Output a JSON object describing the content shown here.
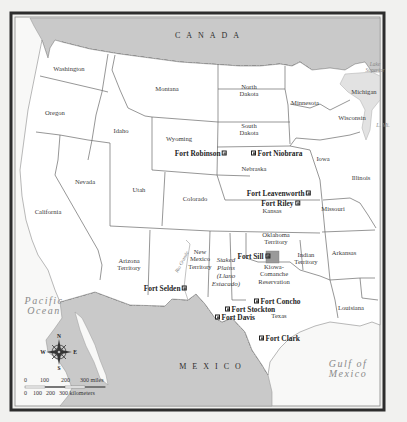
{
  "map": {
    "countries": [
      {
        "id": "canada",
        "label": "CANADA",
        "x": 210,
        "y": 35
      },
      {
        "id": "mexico",
        "label": "MEXICO",
        "x": 213,
        "y": 366
      }
    ],
    "water_bodies": [
      {
        "id": "pacific-ocean",
        "label": "Pacific\nOcean",
        "x": 44,
        "y": 306
      },
      {
        "id": "gulf-of-mexico",
        "label": "Gulf of\nMexico",
        "x": 348,
        "y": 369
      },
      {
        "id": "lake-superior",
        "label": "Lake\nSuperior",
        "x": 375,
        "y": 67
      },
      {
        "id": "lake-michigan",
        "label": "L. Mi.",
        "x": 383,
        "y": 125
      }
    ],
    "states": [
      {
        "id": "washington",
        "label": "Washington",
        "x": 69,
        "y": 69
      },
      {
        "id": "oregon",
        "label": "Oregon",
        "x": 55,
        "y": 113
      },
      {
        "id": "idaho",
        "label": "Idaho",
        "x": 121,
        "y": 131
      },
      {
        "id": "montana",
        "label": "Montana",
        "x": 167,
        "y": 89
      },
      {
        "id": "wyoming",
        "label": "Wyoming",
        "x": 179,
        "y": 139
      },
      {
        "id": "north-dakota",
        "label": "North\nDakota",
        "x": 249,
        "y": 90
      },
      {
        "id": "south-dakota",
        "label": "South\nDakota",
        "x": 249,
        "y": 129
      },
      {
        "id": "minnesota",
        "label": "Minnesota",
        "x": 305,
        "y": 103
      },
      {
        "id": "wisconsin",
        "label": "Wisconsin",
        "x": 352,
        "y": 118
      },
      {
        "id": "michigan",
        "label": "Michigan",
        "x": 364,
        "y": 92
      },
      {
        "id": "iowa",
        "label": "Iowa",
        "x": 323,
        "y": 159
      },
      {
        "id": "illinois",
        "label": "Illinois",
        "x": 361,
        "y": 178
      },
      {
        "id": "nebraska",
        "label": "Nebraska",
        "x": 254,
        "y": 169
      },
      {
        "id": "nevada",
        "label": "Nevada",
        "x": 85,
        "y": 182
      },
      {
        "id": "utah",
        "label": "Utah",
        "x": 139,
        "y": 190
      },
      {
        "id": "colorado",
        "label": "Colorado",
        "x": 195,
        "y": 199
      },
      {
        "id": "kansas",
        "label": "Kansas",
        "x": 272,
        "y": 211
      },
      {
        "id": "missouri",
        "label": "Missouri",
        "x": 333,
        "y": 209
      },
      {
        "id": "california",
        "label": "California",
        "x": 48,
        "y": 212
      },
      {
        "id": "arizona-territory",
        "label": "Arizona\nTerritory",
        "x": 129,
        "y": 264
      },
      {
        "id": "new-mexico-territory",
        "label": "New\nMexico\nTerritory",
        "x": 200,
        "y": 259
      },
      {
        "id": "oklahoma-territory",
        "label": "Oklahoma\nTerritory",
        "x": 276,
        "y": 238
      },
      {
        "id": "indian-territory",
        "label": "Indian\nTerritory",
        "x": 306,
        "y": 258
      },
      {
        "id": "arkansas",
        "label": "Arkansas",
        "x": 344,
        "y": 253
      },
      {
        "id": "kiowa-comanche-reservation",
        "label": "Kiowa-\nComanche\nReservation",
        "x": 274,
        "y": 274
      },
      {
        "id": "texas",
        "label": "Texas",
        "x": 279,
        "y": 316
      },
      {
        "id": "louisiana",
        "label": "Louisiana",
        "x": 351,
        "y": 308
      }
    ],
    "regions": [
      {
        "id": "staked-plains",
        "label": "Staked\nPlains\n(Llano\nEstacado)",
        "x": 226,
        "y": 272
      }
    ],
    "rivers": [
      {
        "id": "rio-grande",
        "label": "Rio Grande",
        "x": 182,
        "y": 262
      }
    ],
    "forts": [
      {
        "id": "fort-robinson",
        "label": "Fort Robinson",
        "x": 227,
        "y": 153,
        "anchor": "right"
      },
      {
        "id": "fort-niobrara",
        "label": "Fort Niobrara",
        "x": 251,
        "y": 153,
        "anchor": "left"
      },
      {
        "id": "fort-leavenworth",
        "label": "Fort Leavenworth",
        "x": 311,
        "y": 193,
        "anchor": "right"
      },
      {
        "id": "fort-riley",
        "label": "Fort Riley",
        "x": 300,
        "y": 203,
        "anchor": "right"
      },
      {
        "id": "fort-sill",
        "label": "Fort Sill",
        "x": 270,
        "y": 256,
        "anchor": "right"
      },
      {
        "id": "fort-selden",
        "label": "Fort Selden",
        "x": 187,
        "y": 288,
        "anchor": "right"
      },
      {
        "id": "fort-concho",
        "label": "Fort Concho",
        "x": 254,
        "y": 301,
        "anchor": "left"
      },
      {
        "id": "fort-stockton",
        "label": "Fort Stockton",
        "x": 225,
        "y": 309,
        "anchor": "left"
      },
      {
        "id": "fort-davis",
        "label": "Fort Davis",
        "x": 215,
        "y": 317,
        "anchor": "left"
      },
      {
        "id": "fort-clark",
        "label": "Fort Clark",
        "x": 259,
        "y": 338,
        "anchor": "left"
      }
    ],
    "compass": {
      "n": "N",
      "s": "S",
      "e": "E",
      "w": "W"
    },
    "scale_bar": {
      "miles_ticks": [
        "0",
        "100",
        "200",
        "300 miles"
      ],
      "km_ticks": [
        "0",
        "100",
        "200",
        "300 kilometers"
      ]
    },
    "colors": {
      "land_us": "#ffffff",
      "land_foreign": "#c9c9c9",
      "water": "#f6f6f5",
      "border": "#6a6a6a",
      "frame": "#2d2d2d",
      "reservation": "#9a9a9a"
    }
  }
}
